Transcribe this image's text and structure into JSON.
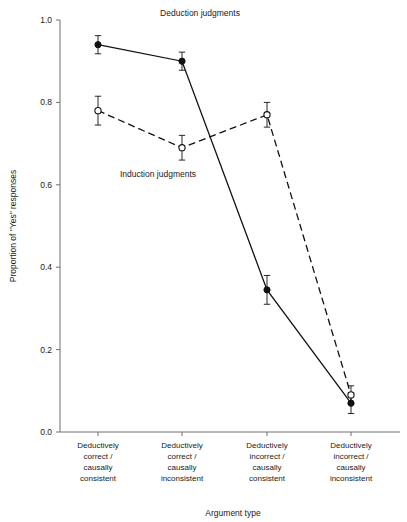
{
  "chart_data": {
    "type": "line",
    "title": "",
    "xlabel": "Argument type",
    "ylabel": "Proportion of \"Yes\" responses",
    "ylim": [
      0.0,
      1.0
    ],
    "yticks": [
      "0.0",
      "0.2",
      "0.4",
      "0.6",
      "0.8",
      "1.0"
    ],
    "ytick_values": [
      0.0,
      0.2,
      0.4,
      0.6,
      0.8,
      1.0
    ],
    "grid": false,
    "legend_position": "inline-annotation",
    "categories": [
      "Deductively correct / causally consistent",
      "Deductively correct / causally inconsistent",
      "Deductively incorrect / causally consistent",
      "Deductively incorrect / causally inconsistent"
    ],
    "category_lines": [
      [
        "Deductively",
        "correct /",
        "causally",
        "consistent"
      ],
      [
        "Deductively",
        "correct /",
        "causally",
        "inconsistent"
      ],
      [
        "Deductively",
        "incorrect /",
        "causally",
        "consistent"
      ],
      [
        "Deductively",
        "incorrect /",
        "causally",
        "inconsistent"
      ]
    ],
    "series": [
      {
        "name": "Deduction judgments",
        "marker": "filled-circle",
        "linestyle": "solid",
        "color": "#111111",
        "values": [
          0.94,
          0.9,
          0.345,
          0.07
        ],
        "errors": [
          0.022,
          0.022,
          0.035,
          0.025
        ]
      },
      {
        "name": "Induction judgments",
        "marker": "open-circle",
        "linestyle": "dashed",
        "color": "#111111",
        "values": [
          0.78,
          0.69,
          0.77,
          0.09
        ],
        "errors": [
          0.035,
          0.03,
          0.03,
          0.022
        ]
      }
    ],
    "annotations": [
      {
        "text": "Deduction judgments",
        "x_px": 200,
        "y_px": 16,
        "anchor": "middle"
      },
      {
        "text": "Induction judgments",
        "x_px": 158,
        "y_px": 177,
        "anchor": "middle"
      }
    ]
  }
}
